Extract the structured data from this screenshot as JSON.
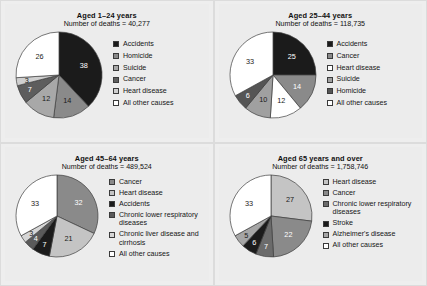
{
  "figure": {
    "background": "#ececec",
    "panel_border": "#dcdcdc"
  },
  "palette": {
    "black": "#1b1b1b",
    "dark_gray": "#4d4d4d",
    "mid_gray": "#8a8a8a",
    "gray": "#a8a8a8",
    "light_gray": "#c9c9c9",
    "pale_gray": "#dedede",
    "white": "#ffffff"
  },
  "chart_data": [
    {
      "id": "aged-1-24",
      "type": "pie",
      "title": "Aged 1–24 years",
      "subtitle": "Number of deaths = 40,277",
      "deaths": "40,277",
      "unit": "percent",
      "legend_position": "right",
      "categories": [
        "Accidents",
        "Homicide",
        "Suicide",
        "Cancer",
        "Heart disease",
        "All other causes"
      ],
      "values": [
        38,
        14,
        12,
        7,
        3,
        26
      ],
      "colors": [
        "#1b1b1b",
        "#8a8a8a",
        "#a8a8a8",
        "#5d5d5d",
        "#cfcfcf",
        "#ffffff"
      ],
      "labels": [
        "38",
        "14",
        "12",
        "7",
        "3",
        "26"
      ],
      "label_colors": [
        "light",
        "dark",
        "dark",
        "light",
        "dark",
        "dark"
      ]
    },
    {
      "id": "aged-25-44",
      "type": "pie",
      "title": "Aged 25–44 years",
      "subtitle": "Number of deaths = 118,735",
      "deaths": "118,735",
      "unit": "percent",
      "legend_position": "right",
      "categories": [
        "Accidents",
        "Cancer",
        "Heart disease",
        "Suicide",
        "Homicide",
        "All other causes"
      ],
      "values": [
        25,
        14,
        12,
        10,
        6,
        33
      ],
      "colors": [
        "#1b1b1b",
        "#8a8a8a",
        "#ffffff",
        "#a0a0a0",
        "#555555",
        "#ffffff"
      ],
      "labels": [
        "25",
        "14",
        "12",
        "10",
        "6",
        "33"
      ],
      "label_colors": [
        "light",
        "light",
        "dark",
        "dark",
        "light",
        "dark"
      ]
    },
    {
      "id": "aged-45-64",
      "type": "pie",
      "title": "Aged 45–64 years",
      "subtitle": "Number of deaths = 489,524",
      "deaths": "489,524",
      "unit": "percent",
      "legend_position": "right",
      "categories": [
        "Cancer",
        "Heart disease",
        "Accidents",
        "Chronic lower respiratory diseases",
        "Chronic liver disease and cirrhosis",
        "All other causes"
      ],
      "values": [
        32,
        21,
        7,
        4,
        3,
        33
      ],
      "colors": [
        "#8a8a8a",
        "#c4c4c4",
        "#1b1b1b",
        "#5a5a5a",
        "#d6d6d6",
        "#ffffff"
      ],
      "labels": [
        "32",
        "21",
        "7",
        "4",
        "3",
        "33"
      ],
      "label_colors": [
        "light",
        "dark",
        "light",
        "light",
        "dark",
        "dark"
      ]
    },
    {
      "id": "aged-65-over",
      "type": "pie",
      "title": "Aged 65 years and over",
      "subtitle": "Number of deaths = 1,758,746",
      "deaths": "1,758,746",
      "unit": "percent",
      "legend_position": "right",
      "categories": [
        "Heart disease",
        "Cancer",
        "Chronic lower respiratory diseases",
        "Stroke",
        "Alzheimer's disease",
        "All other causes"
      ],
      "values": [
        27,
        22,
        7,
        6,
        5,
        33
      ],
      "colors": [
        "#c4c4c4",
        "#8a8a8a",
        "#6b6b6b",
        "#1b1b1b",
        "#a6a6a6",
        "#ffffff"
      ],
      "labels": [
        "27",
        "22",
        "7",
        "6",
        "5",
        "33"
      ],
      "label_colors": [
        "dark",
        "light",
        "light",
        "light",
        "dark",
        "dark"
      ]
    }
  ]
}
